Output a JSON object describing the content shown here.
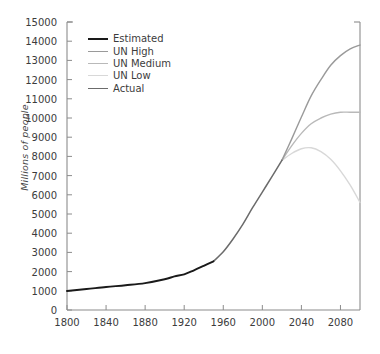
{
  "chart_data": {
    "type": "line",
    "title": "",
    "xlabel": "",
    "ylabel": "Millions of people",
    "xlim": [
      1800,
      2100
    ],
    "ylim": [
      0,
      15000
    ],
    "grid": false,
    "legend_position": "top-left-inside",
    "xticks": [
      1800,
      1840,
      1880,
      1920,
      1960,
      2000,
      2040,
      2080
    ],
    "yticks": [
      0,
      1000,
      2000,
      3000,
      4000,
      5000,
      6000,
      7000,
      8000,
      9000,
      10000,
      11000,
      12000,
      13000,
      14000,
      15000
    ],
    "colors": {
      "estimated": "#1a1a1a",
      "un_high": "#9a9a9a",
      "un_medium": "#b9b9b9",
      "un_low": "#d8d8d8",
      "actual": "#6b6b6b",
      "axis": "#8c8c8c",
      "text": "#3c3c3c"
    },
    "series": [
      {
        "name": "Estimated",
        "color": "#1a1a1a",
        "x": [
          1800,
          1820,
          1840,
          1860,
          1880,
          1900,
          1910,
          1920,
          1930,
          1940,
          1950
        ],
        "values": [
          990,
          1090,
          1200,
          1290,
          1400,
          1600,
          1750,
          1860,
          2070,
          2300,
          2536
        ]
      },
      {
        "name": "UN High",
        "color": "#9a9a9a",
        "x": [
          2020,
          2030,
          2040,
          2050,
          2060,
          2070,
          2080,
          2090,
          2100
        ],
        "values": [
          7795,
          8900,
          10050,
          11150,
          12000,
          12750,
          13250,
          13600,
          13800
        ]
      },
      {
        "name": "UN Medium",
        "color": "#b9b9b9",
        "x": [
          2020,
          2030,
          2040,
          2050,
          2060,
          2070,
          2080,
          2090,
          2100
        ],
        "values": [
          7795,
          8550,
          9200,
          9700,
          10000,
          10200,
          10300,
          10300,
          10300
        ]
      },
      {
        "name": "UN Low",
        "color": "#d8d8d8",
        "x": [
          2020,
          2030,
          2040,
          2050,
          2060,
          2070,
          2080,
          2090,
          2100
        ],
        "values": [
          7795,
          8150,
          8400,
          8450,
          8250,
          7850,
          7250,
          6500,
          5600
        ]
      },
      {
        "name": "Actual",
        "color": "#6b6b6b",
        "x": [
          1950,
          1960,
          1970,
          1980,
          1990,
          2000,
          2010,
          2020
        ],
        "values": [
          2536,
          3034,
          3700,
          4458,
          5327,
          6143,
          6957,
          7795
        ]
      }
    ]
  },
  "axes": {
    "ylabel": "Millions of people",
    "ytick_labels": [
      "0",
      "1000",
      "2000",
      "3000",
      "4000",
      "5000",
      "6000",
      "7000",
      "8000",
      "9000",
      "10000",
      "11000",
      "12000",
      "13000",
      "14000",
      "15000"
    ],
    "xtick_labels": [
      "1800",
      "1840",
      "1880",
      "1920",
      "1960",
      "2000",
      "2040",
      "2080"
    ]
  },
  "legend": {
    "items": [
      {
        "label": "Estimated",
        "color": "#1a1a1a"
      },
      {
        "label": "UN High",
        "color": "#9a9a9a"
      },
      {
        "label": "UN Medium",
        "color": "#b9b9b9"
      },
      {
        "label": "UN Low",
        "color": "#d8d8d8"
      },
      {
        "label": "Actual",
        "color": "#6b6b6b"
      }
    ]
  }
}
